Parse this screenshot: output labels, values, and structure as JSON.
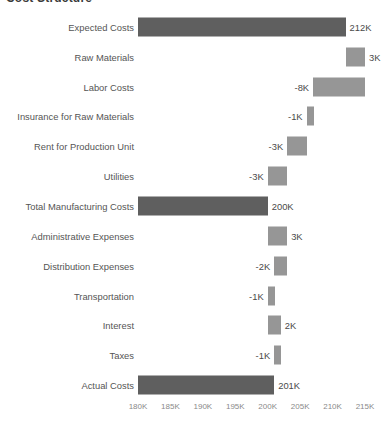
{
  "chart_data": {
    "type": "bar",
    "subtype": "waterfall",
    "title": "Cost Structure",
    "xlabel": "",
    "ylabel": "",
    "xlim": [
      180000,
      215000
    ],
    "x_unit": "K",
    "grid": false,
    "legend": "none",
    "orientation": "horizontal",
    "axis_ticks": [
      "180K",
      "185K",
      "190K",
      "195K",
      "200K",
      "205K",
      "210K",
      "215K"
    ],
    "axis_tick_values": [
      180000,
      185000,
      190000,
      195000,
      200000,
      205000,
      210000,
      215000
    ],
    "colors": {
      "total_bar": "#5f5f5f",
      "change_bar": "#969696",
      "label_text": "#4a4a4a",
      "category_text": "#555555",
      "tick_text": "#8a8a8a",
      "background": "#ffffff"
    },
    "categories": [
      "Expected Costs",
      "Raw Materials",
      "Labor Costs",
      "Insurance for Raw Materials",
      "Rent for Production Unit",
      "Utilities",
      "Total Manufacturing Costs",
      "Administrative Expenses",
      "Distribution Expenses",
      "Transportation",
      "Interest",
      "Taxes",
      "Actual Costs"
    ],
    "values": [
      212,
      3,
      -8,
      -1,
      -3,
      -3,
      200,
      3,
      -2,
      -1,
      2,
      -1,
      201
    ],
    "value_labels": [
      "212K",
      "3K",
      "-8K",
      "-1K",
      "-3K",
      "-3K",
      "200K",
      "3K",
      "-2K",
      "-1K",
      "2K",
      "-1K",
      "201K"
    ],
    "bar_kinds": [
      "total",
      "change",
      "change",
      "change",
      "change",
      "change",
      "total",
      "change",
      "change",
      "change",
      "change",
      "change",
      "total"
    ],
    "running_start": [
      180,
      212,
      215,
      207,
      206,
      203,
      180,
      200,
      203,
      201,
      200,
      202,
      180
    ],
    "running_end": [
      212,
      215,
      207,
      206,
      203,
      200,
      200,
      203,
      201,
      200,
      202,
      201,
      201
    ],
    "label_side": [
      "right",
      "right",
      "left",
      "left",
      "left",
      "left",
      "right",
      "right",
      "left",
      "left",
      "right",
      "left",
      "right"
    ]
  }
}
